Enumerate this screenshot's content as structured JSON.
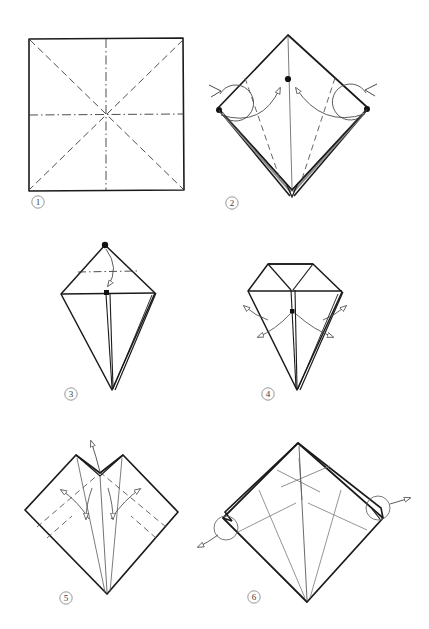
{
  "document": {
    "type": "origami-instruction-diagram",
    "title": "",
    "background_color": "#ffffff",
    "ink_color": "#1a1a1a",
    "light_ink_color": "#6b6b6b",
    "step_label_color": "#3a3a3a",
    "panel_count": 6
  },
  "steps": [
    {
      "number": "1",
      "label": "1",
      "name": "square-with-precreases",
      "description": "Flat square sheet with diagonal valley creases and horizontal / vertical centre creases.",
      "shape": "square",
      "crease_lines": [
        "diagonal-dashed",
        "diagonal-dashed",
        "horizontal-dash-dot",
        "vertical-dash-dot"
      ],
      "marks": [],
      "arrows": []
    },
    {
      "number": "2",
      "label": "2",
      "name": "diamond-fold-side-points-to-centre",
      "description": "Preliminary diamond; both side corners swing in to the marked centre dot. Rotation symbols at left and right.",
      "shape": "diamond",
      "crease_lines": [
        "dashed-left-petal",
        "dashed-right-petal",
        "solid-centre"
      ],
      "marks": [
        "centre-dot",
        "left-corner-dot",
        "right-corner-dot"
      ],
      "arrows": [
        "curved-arrow-left-to-centre",
        "curved-arrow-right-to-centre",
        "rotation-loop-left",
        "rotation-loop-right"
      ]
    },
    {
      "number": "3",
      "label": "3",
      "name": "kite-fold-top-point-down",
      "description": "Kite shape; the top point folds down to the marked centre point along the dash-dot line.",
      "shape": "kite",
      "crease_lines": [
        "horizontal-dash-dot"
      ],
      "marks": [
        "apex-dot",
        "centre-square-mark"
      ],
      "arrows": [
        "curved-arrow-down"
      ]
    },
    {
      "number": "4",
      "label": "4",
      "name": "kite-open-flaps-outward",
      "description": "Folded kite with four outward arrows showing the side flaps being opened out.",
      "shape": "kite-folded-top",
      "crease_lines": [],
      "marks": [
        "centre-square-mark"
      ],
      "arrows": [
        "outward-upper-left",
        "outward-lower-left",
        "outward-upper-right",
        "outward-lower-right"
      ]
    },
    {
      "number": "5",
      "label": "5",
      "name": "diamond-open-petals",
      "description": "Diamond with a V notch at the top; arrows indicate lifting the point up and spreading the inner petals out to both sides.",
      "shape": "diamond-notched",
      "crease_lines": [
        "dashed-left",
        "dashed-right",
        "dashed-inner-left",
        "dashed-inner-right"
      ],
      "marks": [],
      "arrows": [
        "up-arrow-top",
        "double-arrow-left",
        "double-arrow-right"
      ]
    },
    {
      "number": "6",
      "label": "6",
      "name": "diamond-pull-side-points",
      "description": "Completed diamond with all creases; circled callouts at left and right show the side points being pulled outward.",
      "shape": "diamond-rotated",
      "crease_lines": [
        "inner-cross",
        "petal-left",
        "petal-right",
        "centre-spine"
      ],
      "marks": [
        "circle-callout-left",
        "circle-callout-right"
      ],
      "arrows": [
        "pull-arrow-left",
        "pull-arrow-right"
      ]
    }
  ]
}
